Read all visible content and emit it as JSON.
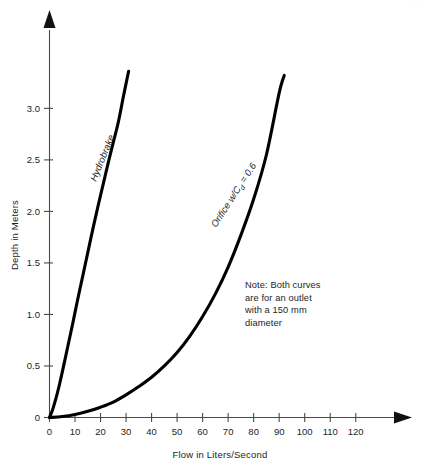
{
  "figure": {
    "background_color": "#ffffff",
    "ink_color": "#000000",
    "axis_color": "#4a4a4a",
    "corner_mark": "...",
    "caption_ghost": ""
  },
  "note": {
    "line1": "Note: Both curves",
    "line2": "are for an outlet",
    "line3": "with a 150 mm",
    "line4": "diameter"
  },
  "labels": {
    "hydrobrake": "Hydrobrake",
    "orifice_main": "Orifice w/C",
    "orifice_sub": "d",
    "orifice_tail": " = 0.6"
  },
  "chart_data": {
    "type": "line",
    "title": "",
    "subtitle": "",
    "xlabel": "Flow in Liters/Second",
    "ylabel": "Depth in Meters",
    "xlim": [
      0,
      125
    ],
    "ylim": [
      0,
      3.45
    ],
    "grid": false,
    "legend_position": "inline-curve-labels",
    "x_ticks": [
      0,
      10,
      20,
      30,
      40,
      50,
      60,
      70,
      80,
      90,
      100,
      110,
      120
    ],
    "x_tick_labels": [
      "0",
      "10",
      "20",
      "30",
      "40",
      "50",
      "60",
      "70",
      "80",
      "90",
      "100",
      "110",
      "120"
    ],
    "y_ticks": [
      0,
      0.5,
      1.0,
      1.5,
      2.0,
      2.5,
      3.0
    ],
    "y_tick_labels": [
      "0",
      "0.5",
      "1.0",
      "1.5",
      "2.0",
      "2.5",
      "3.0"
    ],
    "annotations": [
      {
        "text": "Note: Both curves are for an outlet with a 150 mm diameter",
        "x": 72,
        "y": 1.2
      }
    ],
    "series": [
      {
        "name": "Hydrobrake",
        "label_rotation_deg": -68,
        "x": [
          0,
          1,
          2,
          3,
          4,
          5,
          7,
          9,
          11,
          13,
          15,
          17,
          19,
          21,
          23,
          25,
          27,
          29,
          31
        ],
        "y": [
          0,
          0.06,
          0.14,
          0.23,
          0.33,
          0.44,
          0.67,
          0.9,
          1.14,
          1.37,
          1.6,
          1.83,
          2.05,
          2.26,
          2.47,
          2.67,
          2.87,
          3.12,
          3.36
        ]
      },
      {
        "name": "Orifice w/Cd = 0.6",
        "label_rotation_deg": -57,
        "x": [
          0,
          5,
          10,
          15,
          20,
          25,
          30,
          35,
          40,
          45,
          50,
          55,
          60,
          65,
          70,
          75,
          80,
          85,
          90,
          92
        ],
        "y": [
          0,
          0.01,
          0.03,
          0.06,
          0.1,
          0.15,
          0.22,
          0.3,
          0.39,
          0.5,
          0.63,
          0.79,
          0.98,
          1.2,
          1.46,
          1.77,
          2.12,
          2.55,
          3.15,
          3.32
        ]
      }
    ]
  }
}
